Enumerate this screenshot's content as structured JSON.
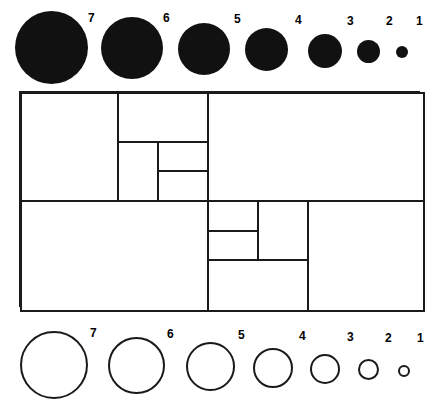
{
  "figure": {
    "background_color": "#ffffff",
    "ink_color": "#1a1a1a"
  },
  "top_legend": {
    "name": "filled-disc-scale",
    "style": "filled",
    "fill_color": "#111111",
    "items": [
      {
        "label": "7",
        "diameter_px": 73,
        "center_x": 51,
        "center_y": 47,
        "label_x": 88,
        "label_y": 12
      },
      {
        "label": "6",
        "diameter_px": 62,
        "center_x": 132,
        "center_y": 48,
        "label_x": 163,
        "label_y": 12
      },
      {
        "label": "5",
        "diameter_px": 52,
        "center_x": 204,
        "center_y": 49,
        "label_x": 234,
        "label_y": 13
      },
      {
        "label": "4",
        "diameter_px": 43,
        "center_x": 267,
        "center_y": 50,
        "label_x": 295,
        "label_y": 14
      },
      {
        "label": "3",
        "diameter_px": 34,
        "center_x": 325,
        "center_y": 51,
        "label_x": 347,
        "label_y": 15
      },
      {
        "label": "2",
        "diameter_px": 23,
        "center_x": 368,
        "center_y": 52,
        "label_x": 386,
        "label_y": 15
      },
      {
        "label": "1",
        "diameter_px": 12,
        "center_x": 402,
        "center_y": 52,
        "label_x": 416,
        "label_y": 15
      }
    ]
  },
  "bottom_legend": {
    "name": "outline-circle-scale",
    "style": "outline",
    "stroke_color": "#1a1a1a",
    "items": [
      {
        "label": "7",
        "diameter_px": 68,
        "center_x": 54,
        "center_y": 365,
        "label_x": 90,
        "label_y": 327
      },
      {
        "label": "6",
        "diameter_px": 57,
        "center_x": 137,
        "center_y": 366,
        "label_x": 167,
        "label_y": 328
      },
      {
        "label": "5",
        "diameter_px": 49,
        "center_x": 210,
        "center_y": 367,
        "label_x": 238,
        "label_y": 329
      },
      {
        "label": "4",
        "diameter_px": 40,
        "center_x": 273,
        "center_y": 368,
        "label_x": 299,
        "label_y": 330
      },
      {
        "label": "3",
        "diameter_px": 30,
        "center_x": 325,
        "center_y": 369,
        "label_x": 347,
        "label_y": 331
      },
      {
        "label": "2",
        "diameter_px": 21,
        "center_x": 368,
        "center_y": 370,
        "label_x": 385,
        "label_y": 332
      },
      {
        "label": "1",
        "diameter_px": 12,
        "center_x": 404,
        "center_y": 371,
        "label_x": 417,
        "label_y": 332
      }
    ]
  },
  "dissection": {
    "name": "squared-rectangle",
    "outer": {
      "x": 19,
      "y": 91,
      "width": 401,
      "height": 216
    },
    "squares": [
      {
        "id": "sq-a",
        "x": 0,
        "y": 0,
        "size": 96,
        "order": 1
      },
      {
        "id": "sq-b",
        "x": 96,
        "y": 0,
        "size": 89,
        "order": 2
      },
      {
        "id": "sq-c",
        "x": 185,
        "y": 0,
        "size": 216,
        "order": 3
      },
      {
        "id": "sq-d",
        "x": 96,
        "y": 49,
        "size": 40,
        "order": 4
      },
      {
        "id": "sq-e",
        "x": 136,
        "y": 49,
        "size": 49,
        "order": 5
      },
      {
        "id": "sq-f",
        "x": 136,
        "y": 78,
        "size": 29,
        "order": 6
      },
      {
        "id": "sq-g",
        "x": 0,
        "y": 108,
        "size": 185,
        "order": 7
      },
      {
        "id": "sq-h",
        "x": 185,
        "y": 108,
        "size": 49,
        "order": 8
      },
      {
        "id": "sq-i",
        "x": 234,
        "y": 108,
        "size": 89,
        "order": 9
      },
      {
        "id": "sq-j",
        "x": 185,
        "y": 137,
        "size": 40,
        "order": 10
      },
      {
        "id": "sq-k",
        "x": 185,
        "y": 177,
        "size": 96,
        "order": 11
      },
      {
        "id": "sq-l",
        "x": 284,
        "y": 108,
        "size": 117,
        "order": 12
      }
    ]
  }
}
